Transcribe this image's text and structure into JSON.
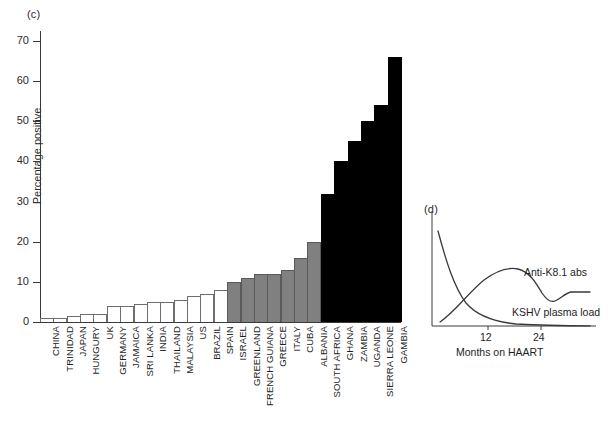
{
  "panels": {
    "c": {
      "tag": "(c)"
    },
    "d": {
      "tag": "(d)"
    }
  },
  "chart_data": [
    {
      "type": "bar",
      "panel": "(c)",
      "title": "",
      "xlabel": "",
      "ylabel": "Percentage positive",
      "ylim": [
        0,
        72
      ],
      "yticks": [
        0,
        10,
        20,
        30,
        40,
        50,
        60,
        70
      ],
      "ytick_labels": [
        "0",
        "10",
        "20",
        "30",
        "40",
        "50",
        "60",
        "70"
      ],
      "grid": false,
      "legend": "none",
      "categories": [
        "CHINA",
        "TRINIDAD",
        "JAPAN",
        "HUNGURY",
        "UK",
        "GERMANY",
        "JAMAICA",
        "SRI LANKA",
        "INDIA",
        "THAILAND",
        "MALAYSIA",
        "US",
        "BRAZIL",
        "SPAIN",
        "ISRAEL",
        "GREENLAND",
        "FRENCH GUIANA",
        "GREECE",
        "ITALY",
        "CUBA",
        "ALBANIA",
        "SOUTH AFRICA",
        "GHANA",
        "ZAMBIA",
        "UGANDA",
        "SIERRA LEONE",
        "GAMBIA"
      ],
      "values": [
        1,
        1,
        1.5,
        2,
        2,
        4,
        4,
        4.5,
        5,
        5,
        5.5,
        6.5,
        7,
        8,
        10,
        11,
        12,
        12,
        13,
        16,
        20,
        32,
        40,
        45,
        50,
        54,
        66
      ],
      "bar_fills": [
        "white",
        "white",
        "white",
        "white",
        "white",
        "white",
        "white",
        "white",
        "white",
        "white",
        "white",
        "white",
        "white",
        "white",
        "gray",
        "gray",
        "gray",
        "gray",
        "gray",
        "gray",
        "gray",
        "black",
        "black",
        "black",
        "black",
        "black",
        "black"
      ],
      "fill_colors": {
        "white": "#ffffff",
        "gray": "#808080",
        "black": "#000000"
      }
    },
    {
      "type": "line",
      "panel": "(d)",
      "title": "",
      "xlabel": "Months on HAART",
      "ylabel": "",
      "xticks": [
        12,
        24
      ],
      "xtick_labels": [
        "12",
        "24"
      ],
      "yticks": [],
      "grid": false,
      "legend": "inline-annotations",
      "series": [
        {
          "name": "Anti-K8.1 abs",
          "description": "rises from low baseline, peaks near month 10, declines, then plateaus",
          "x": [
            0,
            3,
            6,
            9,
            12,
            15,
            18,
            21,
            24,
            27,
            30
          ],
          "y": [
            2,
            18,
            36,
            50,
            55,
            52,
            43,
            36,
            33,
            38,
            40
          ]
        },
        {
          "name": "KSHV plasma load",
          "description": "high at baseline, decays rapidly toward zero",
          "x": [
            0,
            3,
            6,
            9,
            12,
            15,
            18,
            21,
            24,
            27,
            30
          ],
          "y": [
            72,
            50,
            33,
            22,
            14,
            9,
            6,
            4,
            3,
            3,
            3
          ]
        }
      ]
    }
  ],
  "panel_c": {
    "y_axis_title": "Percentage positive",
    "ytick_labels": [
      "70",
      "60",
      "50",
      "40",
      "30",
      "20",
      "10",
      "0"
    ],
    "bars": [
      {
        "label": "CHINA",
        "value": 1,
        "fill": "white"
      },
      {
        "label": "TRINIDAD",
        "value": 1,
        "fill": "white"
      },
      {
        "label": "JAPAN",
        "value": 1.5,
        "fill": "white"
      },
      {
        "label": "HUNGURY",
        "value": 2,
        "fill": "white"
      },
      {
        "label": "UK",
        "value": 2,
        "fill": "white"
      },
      {
        "label": "GERMANY",
        "value": 4,
        "fill": "white"
      },
      {
        "label": "JAMAICA",
        "value": 4,
        "fill": "white"
      },
      {
        "label": "SRI LANKA",
        "value": 4.5,
        "fill": "white"
      },
      {
        "label": "INDIA",
        "value": 5,
        "fill": "white"
      },
      {
        "label": "THAILAND",
        "value": 5,
        "fill": "white"
      },
      {
        "label": "MALAYSIA",
        "value": 5.5,
        "fill": "white"
      },
      {
        "label": "US",
        "value": 6.5,
        "fill": "white"
      },
      {
        "label": "BRAZIL",
        "value": 7,
        "fill": "white"
      },
      {
        "label": "SPAIN",
        "value": 8,
        "fill": "white"
      },
      {
        "label": "ISRAEL",
        "value": 10,
        "fill": "gray"
      },
      {
        "label": "GREENLAND",
        "value": 11,
        "fill": "gray"
      },
      {
        "label": "FRENCH GUIANA",
        "value": 12,
        "fill": "gray"
      },
      {
        "label": "GREECE",
        "value": 12,
        "fill": "gray"
      },
      {
        "label": "ITALY",
        "value": 13,
        "fill": "gray"
      },
      {
        "label": "CUBA",
        "value": 16,
        "fill": "gray"
      },
      {
        "label": "ALBANIA",
        "value": 20,
        "fill": "gray"
      },
      {
        "label": "SOUTH AFRICA",
        "value": 32,
        "fill": "black"
      },
      {
        "label": "GHANA",
        "value": 40,
        "fill": "black"
      },
      {
        "label": "ZAMBIA",
        "value": 45,
        "fill": "black"
      },
      {
        "label": "UGANDA",
        "value": 50,
        "fill": "black"
      },
      {
        "label": "SIERRA LEONE",
        "value": 54,
        "fill": "black"
      },
      {
        "label": "GAMBIA",
        "value": 66,
        "fill": "black"
      }
    ]
  },
  "panel_d": {
    "legend_abs": "Anti-K8.1 abs",
    "legend_load": "KSHV plasma load",
    "xtick_12": "12",
    "xtick_24": "24",
    "x_axis_title": "Months on HAART"
  }
}
